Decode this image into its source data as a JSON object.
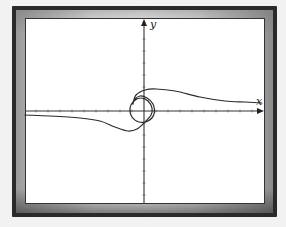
{
  "chart_data": {
    "type": "line",
    "title": "",
    "xlabel": "x",
    "ylabel": "y",
    "grid": false,
    "legend": null,
    "axes": {
      "x_axis": {
        "label": "x",
        "arrow": true,
        "tick_spacing_px": 12
      },
      "y_axis": {
        "label": "y",
        "arrow": true,
        "tick_spacing_px": 12
      }
    },
    "series": [
      {
        "name": "Euler (Cornu) spiral",
        "description": "Curve passes through the origin, spirals around it, and approaches a horizontal asymptote above the x-axis on the right and below on the left",
        "points_px": [
          [
            25,
            115
          ],
          [
            50,
            116
          ],
          [
            80,
            118
          ],
          [
            100,
            121
          ],
          [
            115,
            127
          ],
          [
            128,
            131
          ],
          [
            137,
            129
          ],
          [
            145,
            122
          ],
          [
            151,
            115
          ],
          [
            152,
            108
          ],
          [
            148,
            101
          ],
          [
            141,
            98
          ],
          [
            134,
            101
          ],
          [
            130,
            108
          ],
          [
            132,
            117
          ],
          [
            139,
            122
          ],
          [
            148,
            121
          ],
          [
            154,
            114
          ],
          [
            153,
            104
          ],
          [
            147,
            98
          ],
          [
            140,
            96
          ],
          [
            134,
            100
          ],
          [
            133,
            104
          ],
          [
            136,
            95
          ],
          [
            145,
            90
          ],
          [
            156,
            89
          ],
          [
            175,
            91
          ],
          [
            200,
            97
          ],
          [
            225,
            101
          ],
          [
            245,
            102
          ],
          [
            262,
            103
          ]
        ]
      }
    ]
  },
  "labels": {
    "x_axis": "x",
    "y_axis": "y"
  },
  "colors": {
    "curve": "#2b2b2b",
    "axes": "#333333",
    "frame": "#2a2a2a",
    "background": "#ffffff"
  }
}
